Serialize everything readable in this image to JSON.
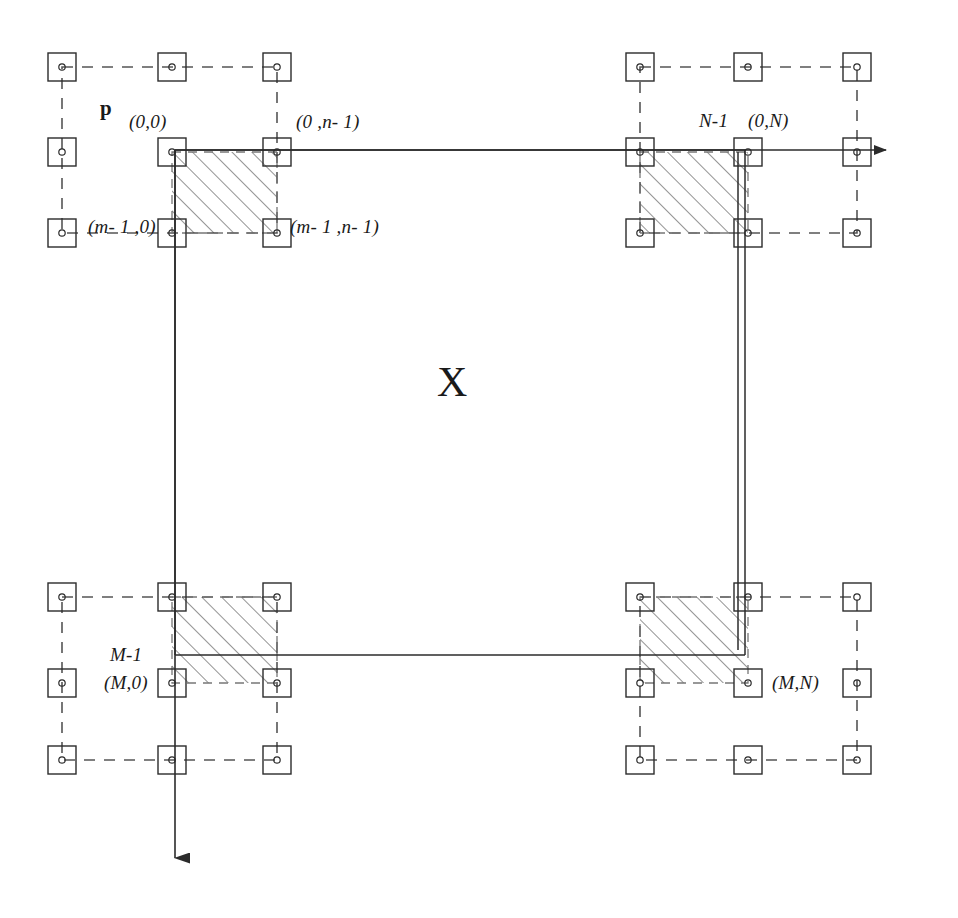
{
  "figure": {
    "type": "technical-diagram",
    "title_glyph": "X",
    "background": "#ffffff",
    "ink_color": "#2b2b2b",
    "labels": {
      "p": "p",
      "center": "X",
      "top_left_00": "(0,0)",
      "top_left_0n1": "(0 ,n- 1)",
      "top_left_m10": "(m- 1 ,0)",
      "top_left_m1n1": "(m- 1  ,n- 1)",
      "top_right_N1": "N-1",
      "top_right_0N": "(0,N)",
      "bottom_left_M1": "M-1",
      "bottom_left_M0": "(M,0)",
      "bottom_right_MN": "(M,N)"
    },
    "geometry": {
      "node_size": 28,
      "node_dot_radius": 3,
      "groups": [
        {
          "name": "top-left",
          "cols": [
            62,
            172,
            277
          ],
          "rows": [
            67,
            152,
            233
          ]
        },
        {
          "name": "top-right",
          "cols": [
            640,
            748,
            857
          ],
          "rows": [
            67,
            152,
            233
          ]
        },
        {
          "name": "bottom-left",
          "cols": [
            62,
            172,
            277
          ],
          "rows": [
            597,
            683,
            760
          ]
        },
        {
          "name": "bottom-right",
          "cols": [
            640,
            748,
            857
          ],
          "rows": [
            597,
            683,
            760
          ]
        }
      ],
      "hatch_blocks": [
        {
          "name": "top-left",
          "x": 172,
          "y": 152,
          "w": 105,
          "h": 81
        },
        {
          "name": "top-right",
          "x": 640,
          "y": 152,
          "w": 108,
          "h": 81
        },
        {
          "name": "bottom-left",
          "x": 172,
          "y": 597,
          "w": 105,
          "h": 86
        },
        {
          "name": "bottom-right",
          "x": 640,
          "y": 597,
          "w": 108,
          "h": 86
        }
      ],
      "axes": {
        "horizontal": {
          "x1": 175,
          "y": 150,
          "x2": 895,
          "arrow": "right"
        },
        "vertical": {
          "x": 175,
          "y1": 150,
          "y2": 872,
          "arrow": "down"
        }
      },
      "frame": {
        "left": 175,
        "right": 745,
        "top": 150,
        "bottom": 655
      }
    },
    "legend_note": "hatched blocks = sampled windows at the four corners of grid X"
  }
}
